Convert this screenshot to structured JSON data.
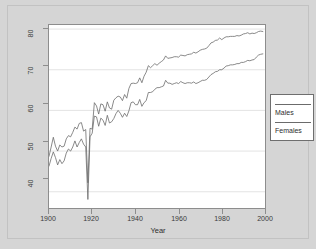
{
  "figure": {
    "background_color": "#d5d5d5",
    "plot_background_color": "#ffffff",
    "axis_color": "#8d8d8d",
    "grid_color": "#e3e3e3"
  },
  "legend": {
    "entries": [
      {
        "label": "Males",
        "color": "#6b6b6b"
      },
      {
        "label": "Females",
        "color": "#6b6b6b"
      }
    ]
  },
  "chart_data": {
    "type": "line",
    "title": "",
    "xlabel": "Year",
    "ylabel": "",
    "xlim": [
      1900,
      2000
    ],
    "ylim": [
      36,
      81
    ],
    "xticks": [
      1900,
      1920,
      1940,
      1960,
      1980,
      2000
    ],
    "yticks": [
      40,
      50,
      60,
      70,
      80
    ],
    "grid": true,
    "legend_position": "right-outside",
    "x": [
      1900,
      1901,
      1902,
      1903,
      1904,
      1905,
      1906,
      1907,
      1908,
      1909,
      1910,
      1911,
      1912,
      1913,
      1914,
      1915,
      1916,
      1917,
      1918,
      1919,
      1920,
      1921,
      1922,
      1923,
      1924,
      1925,
      1926,
      1927,
      1928,
      1929,
      1930,
      1931,
      1932,
      1933,
      1934,
      1935,
      1936,
      1937,
      1938,
      1939,
      1940,
      1941,
      1942,
      1943,
      1944,
      1945,
      1946,
      1947,
      1948,
      1949,
      1950,
      1951,
      1952,
      1953,
      1954,
      1955,
      1956,
      1957,
      1958,
      1959,
      1960,
      1961,
      1962,
      1963,
      1964,
      1965,
      1966,
      1967,
      1968,
      1969,
      1970,
      1971,
      1972,
      1973,
      1974,
      1975,
      1976,
      1977,
      1978,
      1979,
      1980,
      1981,
      1982,
      1983,
      1984,
      1985,
      1986,
      1987,
      1988,
      1989,
      1990,
      1991,
      1992,
      1993,
      1994,
      1995,
      1996,
      1997,
      1998,
      1999
    ],
    "series": [
      {
        "name": "Females",
        "color": "#6b6b6b",
        "values": [
          48.7,
          51.0,
          53.4,
          51.2,
          50.0,
          51.5,
          51.0,
          51.2,
          53.0,
          53.8,
          53.5,
          54.6,
          55.9,
          55.4,
          56.8,
          57.0,
          54.9,
          55.3,
          42.2,
          55.6,
          55.4,
          61.9,
          61.1,
          59.1,
          61.6,
          61.4,
          59.8,
          62.1,
          60.6,
          60.3,
          62.5,
          63.1,
          63.5,
          63.3,
          62.4,
          63.9,
          63.0,
          65.4,
          66.6,
          66.7,
          66.6,
          66.8,
          68.0,
          66.8,
          68.4,
          69.4,
          71.0,
          70.5,
          71.0,
          71.5,
          71.1,
          71.6,
          72.0,
          72.4,
          73.4,
          72.8,
          72.9,
          73.0,
          73.2,
          73.2,
          73.1,
          73.6,
          73.5,
          73.4,
          73.7,
          73.8,
          73.9,
          74.3,
          74.1,
          74.4,
          74.8,
          75.0,
          75.1,
          75.3,
          75.9,
          76.6,
          76.8,
          77.2,
          77.3,
          77.8,
          77.4,
          77.8,
          78.1,
          78.1,
          78.2,
          78.2,
          78.2,
          78.4,
          78.3,
          78.5,
          78.8,
          78.9,
          79.1,
          78.8,
          79.0,
          78.9,
          79.1,
          79.4,
          79.5,
          79.4
        ]
      },
      {
        "name": "Males",
        "color": "#6b6b6b",
        "values": [
          46.3,
          48.2,
          49.8,
          48.4,
          46.6,
          47.9,
          46.9,
          47.6,
          49.5,
          50.5,
          50.0,
          51.0,
          52.5,
          51.0,
          52.1,
          53.0,
          51.7,
          51.0,
          38.1,
          53.5,
          54.4,
          58.6,
          58.4,
          56.1,
          58.1,
          57.6,
          56.3,
          58.8,
          56.9,
          57.2,
          58.0,
          59.2,
          60.0,
          59.3,
          58.3,
          59.3,
          58.5,
          59.9,
          61.9,
          62.1,
          61.4,
          61.4,
          62.7,
          61.0,
          61.9,
          62.4,
          64.4,
          64.4,
          64.6,
          65.2,
          65.6,
          65.6,
          65.8,
          66.0,
          67.4,
          66.7,
          66.7,
          66.4,
          66.6,
          66.8,
          66.6,
          67.1,
          66.8,
          66.6,
          66.8,
          66.8,
          66.7,
          67.0,
          66.6,
          66.8,
          67.1,
          67.4,
          67.4,
          67.6,
          68.2,
          68.8,
          69.1,
          69.5,
          69.6,
          70.0,
          70.0,
          70.4,
          70.9,
          71.0,
          71.2,
          71.2,
          71.3,
          71.5,
          71.5,
          71.8,
          71.8,
          72.0,
          72.3,
          72.2,
          72.4,
          72.5,
          73.1,
          73.6,
          73.8,
          73.9
        ]
      }
    ]
  }
}
